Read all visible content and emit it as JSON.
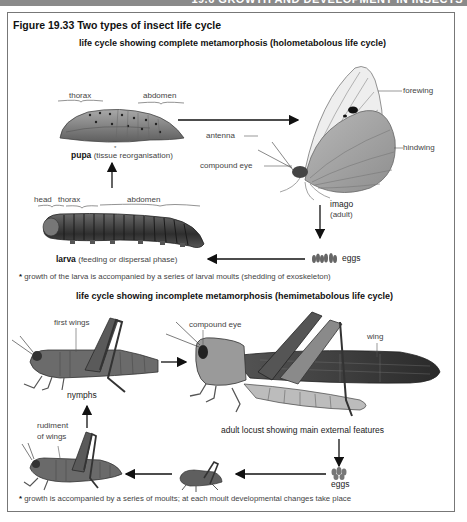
{
  "header": {
    "running_title": "19.6  GROWTH AND DEVELOPMENT IN INSECTS"
  },
  "figure": {
    "title": "Figure 19.33  Two types of insect life cycle"
  },
  "complete": {
    "title": "life cycle showing complete metamorphosis (holometabolous life cycle)",
    "pupa": {
      "label_thorax": "thorax",
      "label_abdomen": "abdomen",
      "name": "pupa",
      "desc": "(tissue reorganisation)"
    },
    "imago": {
      "label_forewing": "forewing",
      "label_hindwing": "hindwing",
      "label_antenna": "antenna",
      "label_compound_eye": "compound eye",
      "name": "imago",
      "desc": "(adult)"
    },
    "larva": {
      "label_head": "head",
      "label_thorax": "thorax",
      "label_abdomen": "abdomen",
      "name": "larva",
      "desc": "(feeding or dispersal phase)"
    },
    "eggs": {
      "label": "eggs"
    },
    "note_star": "*",
    "note": "growth of the larva is accompanied by a series of larval moults (shedding of exoskeleton)"
  },
  "incomplete": {
    "title": "life cycle showing incomplete metamorphosis (hemimetabolous life cycle)",
    "nymph_large": {
      "label_first_wings": "first wings"
    },
    "nymphs_label": "nymphs",
    "nymph_medium": {
      "label_rudiment": "rudiment",
      "label_of_wings": "of wings"
    },
    "adult": {
      "label_compound_eye": "compound eye",
      "label_wing": "wing",
      "caption": "adult locust showing main external features"
    },
    "eggs": {
      "label": "eggs"
    },
    "note_star": "*",
    "note": "growth is accompanied by a series of moults; at each moult developmental changes take place"
  },
  "colors": {
    "frame": "#777777",
    "topbar": "#8a8a8a",
    "arrow": "#111111",
    "insect_dark": "#3a3a3a",
    "insect_mid": "#7a7a7a",
    "insect_light": "#bdbdbd"
  }
}
